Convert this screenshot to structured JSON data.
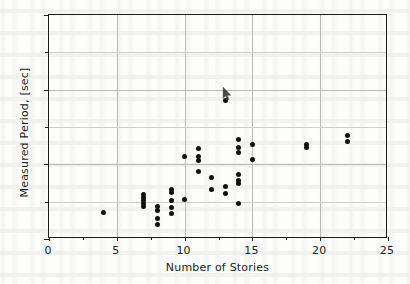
{
  "figure": {
    "background_color": "#fdfdfc",
    "marker_color": "#111111",
    "grid_color": "#b9b9b9",
    "axis_color": "#1a1a1a"
  },
  "chart_data": {
    "type": "scatter",
    "title": "",
    "xlabel": "Number of Stories",
    "ylabel": "Measured Period, [sec]",
    "xlim": [
      0,
      25
    ],
    "ylim": [
      0,
      3
    ],
    "xticks": [
      0,
      5,
      10,
      15,
      20,
      25
    ],
    "xticklabels": [
      "0",
      "5",
      "10",
      "15",
      "20",
      "25"
    ],
    "xminorticks": [
      2.5,
      7.5,
      12.5,
      17.5,
      22.5
    ],
    "yticks": [
      0,
      1,
      2,
      3
    ],
    "yticklabels": [
      "0",
      "1",
      "2",
      "3"
    ],
    "yminorticks": [
      0.5,
      1.5,
      2.5
    ],
    "grid": true,
    "legend": "none",
    "series": [
      {
        "name": "Measured buildings",
        "marker": "circle",
        "color": "#111111",
        "points": [
          [
            4.0,
            0.36
          ],
          [
            7.0,
            0.59
          ],
          [
            7.0,
            0.55
          ],
          [
            7.0,
            0.51
          ],
          [
            7.0,
            0.47
          ],
          [
            7.0,
            0.43
          ],
          [
            8.0,
            0.43
          ],
          [
            8.0,
            0.38
          ],
          [
            8.0,
            0.27
          ],
          [
            8.0,
            0.2
          ],
          [
            9.0,
            0.66
          ],
          [
            9.0,
            0.62
          ],
          [
            9.0,
            0.52
          ],
          [
            9.0,
            0.42
          ],
          [
            9.0,
            0.34
          ],
          [
            10.0,
            1.1
          ],
          [
            10.0,
            0.53
          ],
          [
            11.0,
            1.21
          ],
          [
            11.0,
            1.1
          ],
          [
            11.0,
            1.05
          ],
          [
            11.0,
            0.9
          ],
          [
            12.0,
            0.83
          ],
          [
            12.0,
            0.66
          ],
          [
            13.0,
            1.85
          ],
          [
            13.0,
            0.7
          ],
          [
            13.0,
            0.61
          ],
          [
            14.0,
            1.33
          ],
          [
            14.0,
            1.22
          ],
          [
            14.0,
            1.16
          ],
          [
            14.0,
            0.87
          ],
          [
            14.0,
            0.79
          ],
          [
            14.0,
            0.75
          ],
          [
            14.0,
            0.47
          ],
          [
            15.0,
            1.27
          ],
          [
            15.0,
            1.07
          ],
          [
            19.0,
            1.26
          ],
          [
            19.0,
            1.22
          ],
          [
            22.0,
            1.39
          ],
          [
            22.0,
            1.3
          ]
        ]
      }
    ],
    "annotations": [
      {
        "name": "mouse-cursor",
        "kind": "cursor-arrow",
        "x": 13.0,
        "y": 1.9
      }
    ]
  }
}
